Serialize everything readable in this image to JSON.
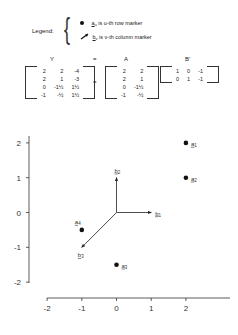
{
  "legend": {
    "title": "Legend:",
    "items": [
      {
        "symbol": "dot",
        "label_main": "a",
        "label_sub": "u",
        "text": " is u-th row marker"
      },
      {
        "symbol": "arrow",
        "label_main": "b",
        "label_sub": "v",
        "text": " is v-th column marker"
      }
    ]
  },
  "equation": {
    "labels": [
      "Y",
      "=",
      "A",
      "B'"
    ],
    "operator": "=",
    "Y": [
      [
        "2",
        "2",
        "-4"
      ],
      [
        "2",
        "1",
        "-3"
      ],
      [
        "0",
        "-1½",
        "1½"
      ],
      [
        "-1",
        "-½",
        "1½"
      ]
    ],
    "A": [
      [
        "2",
        "2"
      ],
      [
        "2",
        "1"
      ],
      [
        "0",
        "-1½"
      ],
      [
        "-1",
        "-½"
      ]
    ],
    "B": [
      [
        "1",
        "0",
        "-1"
      ],
      [
        "0",
        "1",
        "-1"
      ]
    ]
  },
  "chart_data": {
    "type": "scatter",
    "title": "",
    "xlabel": "",
    "ylabel": "",
    "xlim": [
      -2,
      3
    ],
    "ylim": [
      -2,
      2
    ],
    "x_ticks": [
      "-2",
      "-1",
      "0",
      "1",
      "2"
    ],
    "y_ticks": [
      "2",
      "1",
      "0",
      "-1",
      "-2"
    ],
    "grid": false,
    "series": [
      {
        "name": "row markers",
        "marker": "dot",
        "points": [
          {
            "label": "a1",
            "x": 2,
            "y": 2
          },
          {
            "label": "a2",
            "x": 2,
            "y": 1
          },
          {
            "label": "a3",
            "x": 0,
            "y": -1.5
          },
          {
            "label": "a4",
            "x": -1,
            "y": -0.5
          }
        ]
      },
      {
        "name": "column markers",
        "marker": "arrow",
        "points": [
          {
            "label": "b1",
            "x": 1,
            "y": 0
          },
          {
            "label": "b2",
            "x": 0,
            "y": 1
          },
          {
            "label": "b3",
            "x": -1,
            "y": -1
          }
        ]
      }
    ]
  }
}
